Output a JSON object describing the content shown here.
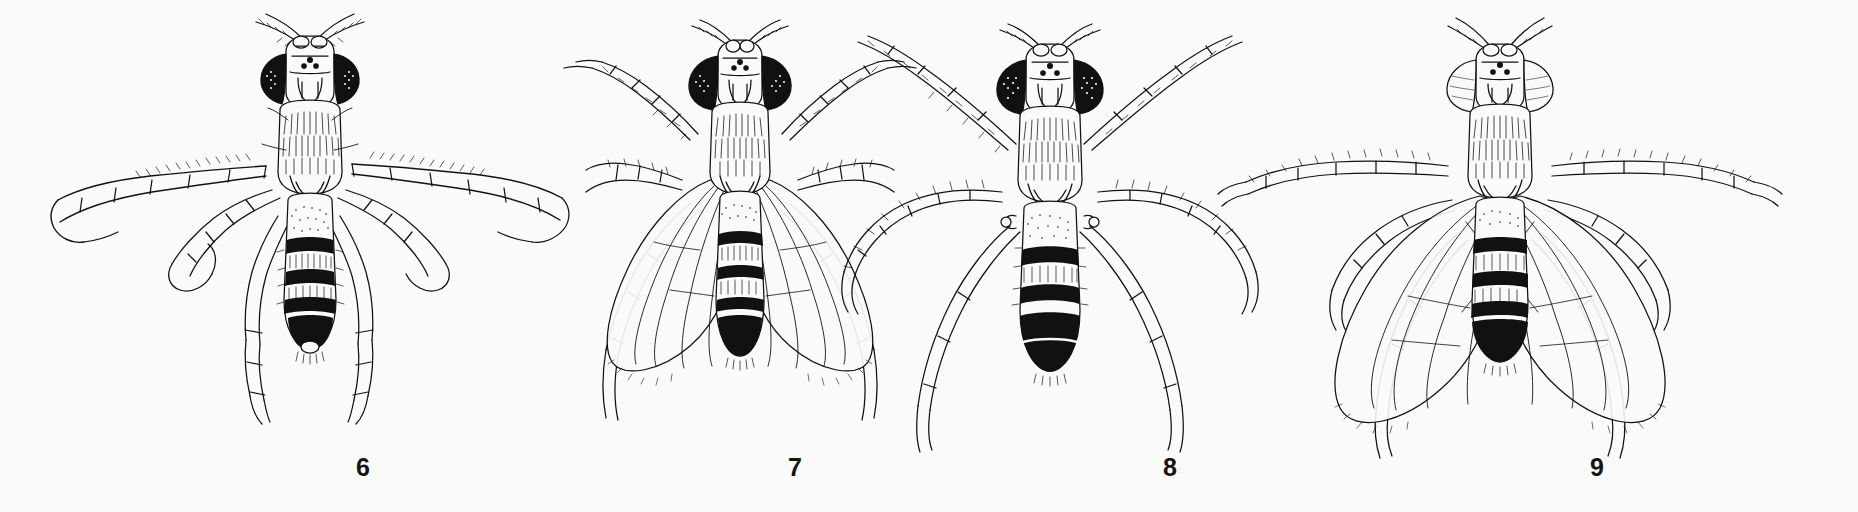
{
  "plate": {
    "background_color": "#fafafa",
    "ink_color": "#111111",
    "medium": "black ink line drawing",
    "width": 1858,
    "height": 512,
    "figure_count": 4
  },
  "figures": [
    {
      "number": "6",
      "label_x": 363,
      "label_y": 455,
      "cell_x": 40,
      "cell_width": 540,
      "eye_color": "#111111",
      "eye_style": "solid dark",
      "wings": "held out to the sides, long and narrow, extended laterally",
      "legs": "spread, long slender tarsi extending far out to left and right",
      "abdomen_bands": [
        "pale",
        "black",
        "pale",
        "black",
        "pale",
        "black",
        "black"
      ],
      "thorax": "densely hairy, longitudinally striate",
      "ocelli": 3,
      "antennae": "short, arista plumose",
      "halteres_visible": false
    },
    {
      "number": "7",
      "label_x": 795,
      "label_y": 455,
      "cell_x": 540,
      "cell_width": 400,
      "eye_color": "#111111",
      "eye_style": "solid dark, large",
      "wings": "folded flat over the abdomen, venation visible, overlapping",
      "legs": "long and slender, splayed laterally",
      "abdomen_bands": [
        "pale",
        "black",
        "pale",
        "black",
        "pale",
        "black",
        "black"
      ],
      "thorax": "densely hairy, longitudinally striate",
      "ocelli": 3,
      "antennae": "short, arista plumose",
      "halteres_visible": false
    },
    {
      "number": "8",
      "label_x": 1170,
      "label_y": 455,
      "cell_x": 830,
      "cell_width": 440,
      "eye_color": "#111111",
      "eye_style": "solid dark, coarsely faceted",
      "wings": "absent / vestigial, not visible",
      "legs": "long, strongly curved and bristly, sweeping outward",
      "abdomen_bands": [
        "pale",
        "black",
        "pale",
        "black",
        "black",
        "black"
      ],
      "thorax": "densely hairy, longitudinally striate",
      "ocelli": 3,
      "antennae": "short, arista plumose",
      "halteres_visible": true
    },
    {
      "number": "9",
      "label_x": 1597,
      "label_y": 455,
      "cell_x": 1180,
      "cell_width": 640,
      "eye_color": "#fafafa",
      "eye_style": "pale / unpigmented outline only",
      "wings": "spread wide over and beyond the abdomen, crossing venation",
      "legs": "slender, spread laterally",
      "abdomen_bands": [
        "pale",
        "black",
        "pale",
        "black",
        "pale",
        "black",
        "black"
      ],
      "thorax": "densely hairy, longitudinally striate",
      "ocelli": 3,
      "antennae": "short, arista plumose",
      "halteres_visible": false
    }
  ]
}
